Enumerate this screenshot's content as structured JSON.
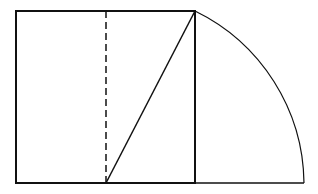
{
  "diagram": {
    "colors": {
      "stroke": "#111111",
      "background": "#ffffff"
    },
    "square": {
      "x": 16,
      "y": 11,
      "width": 179,
      "height": 172
    },
    "midline": {
      "x": 106,
      "y1": 11,
      "y2": 183,
      "style": "dashed"
    },
    "diagonal": {
      "x1": 106,
      "y1": 183,
      "x2": 195,
      "y2": 11
    },
    "arc": {
      "cx": 106,
      "cy": 183,
      "from": [
        195,
        11
      ],
      "to": [
        304,
        183
      ]
    },
    "extension": {
      "x1": 195,
      "x2": 304,
      "y": 183
    }
  }
}
